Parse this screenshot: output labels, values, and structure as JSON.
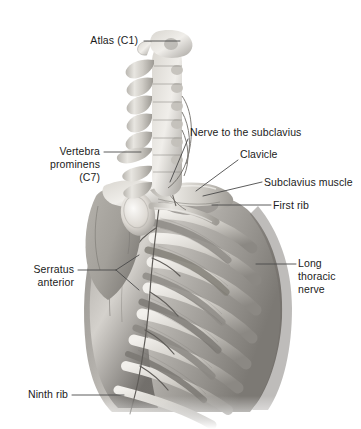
{
  "figure": {
    "style": "grayscale anatomical illustration",
    "background_color": "#ffffff",
    "text_color": "#1b1b1b",
    "leader_line_color": "#4a4a4a"
  },
  "labels": [
    {
      "id": "atlas-c1",
      "name": "label-atlas-c1",
      "lines": [
        "Atlas (C1)"
      ],
      "align": "right",
      "text_x": 72,
      "text_y": 34,
      "text_w": 66,
      "leader": [
        [
          144,
          41
        ],
        [
          180,
          41
        ]
      ]
    },
    {
      "id": "vertebra-prominens-c7",
      "name": "label-vertebra-prominens-c7",
      "lines": [
        "Vertebra",
        "prominens",
        "(C7)"
      ],
      "align": "right",
      "text_x": 22,
      "text_y": 145,
      "text_w": 78,
      "leader": [
        [
          104,
          152
        ],
        [
          141,
          152
        ]
      ]
    },
    {
      "id": "nerve-to-the-subclavius",
      "name": "label-nerve-to-the-subclavius",
      "lines": [
        "Nerve to the subclavius"
      ],
      "align": "left",
      "text_x": 190,
      "text_y": 126,
      "text_w": 124,
      "leader": [
        [
          188,
          139
        ],
        [
          170,
          182
        ]
      ]
    },
    {
      "id": "clavicle",
      "name": "label-clavicle",
      "lines": [
        "Clavicle"
      ],
      "align": "left",
      "text_x": 240,
      "text_y": 148,
      "text_w": 46,
      "leader": [
        [
          238,
          160
        ],
        [
          196,
          191
        ]
      ]
    },
    {
      "id": "subclavius-muscle",
      "name": "label-subclavius-muscle",
      "lines": [
        "Subclavius muscle"
      ],
      "align": "left",
      "text_x": 264,
      "text_y": 176,
      "text_w": 95,
      "leader": [
        [
          262,
          182
        ],
        [
          203,
          196
        ]
      ]
    },
    {
      "id": "first-rib",
      "name": "label-first-rib",
      "lines": [
        "First rib"
      ],
      "align": "left",
      "text_x": 273,
      "text_y": 199,
      "text_w": 44,
      "leader": [
        [
          271,
          205
        ],
        [
          212,
          205
        ]
      ]
    },
    {
      "id": "long-thoracic-nerve",
      "name": "label-long-thoracic-nerve",
      "lines": [
        "Long",
        "thoracic",
        "nerve"
      ],
      "align": "left",
      "text_x": 298,
      "text_y": 257,
      "text_w": 52,
      "leader": [
        [
          296,
          264
        ],
        [
          256,
          264
        ]
      ]
    },
    {
      "id": "serratus-anterior",
      "name": "label-serratus-anterior",
      "lines": [
        "Serratus",
        "anterior"
      ],
      "align": "right",
      "text_x": 18,
      "text_y": 263,
      "text_w": 56,
      "leader": [
        [
          78,
          270
        ],
        [
          116,
          270
        ]
      ],
      "leader_branches": [
        [
          [
            116,
            270
          ],
          [
            139,
            255
          ]
        ],
        [
          [
            116,
            270
          ],
          [
            139,
            290
          ]
        ]
      ]
    },
    {
      "id": "ninth-rib",
      "name": "label-ninth-rib",
      "lines": [
        "Ninth rib"
      ],
      "align": "right",
      "text_x": 18,
      "text_y": 388,
      "text_w": 50,
      "leader": [
        [
          72,
          395
        ],
        [
          124,
          395
        ]
      ]
    }
  ],
  "anatomy_parts": [
    {
      "name": "atlas-vertebra",
      "label": "Atlas (C1)"
    },
    {
      "name": "cervical-vertebral-column",
      "label": "Cervical vertebrae C1-C7"
    },
    {
      "name": "vertebra-prominens",
      "label": "Vertebra prominens (C7)"
    },
    {
      "name": "clavicle-bone",
      "label": "Clavicle"
    },
    {
      "name": "subclavius-muscle-body",
      "label": "Subclavius muscle"
    },
    {
      "name": "nerve-to-subclavius-branch",
      "label": "Nerve to the subclavius"
    },
    {
      "name": "first-rib-bone",
      "label": "First rib"
    },
    {
      "name": "scapula-bone",
      "label": "Scapula"
    },
    {
      "name": "humeral-head",
      "label": "Head of humerus"
    },
    {
      "name": "serratus-anterior-muscle",
      "label": "Serratus anterior"
    },
    {
      "name": "long-thoracic-nerve-trunk",
      "label": "Long thoracic nerve"
    },
    {
      "name": "rib-cage",
      "label": "Ribs"
    },
    {
      "name": "ninth-rib-bone",
      "label": "Ninth rib"
    }
  ]
}
